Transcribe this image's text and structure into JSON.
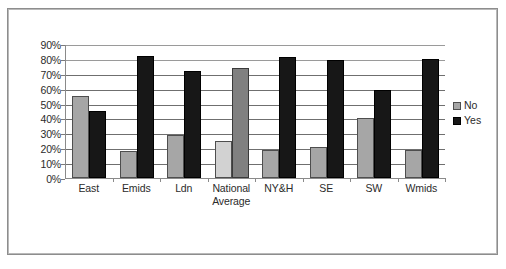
{
  "chart_data": {
    "type": "bar",
    "title": "",
    "subtitle": "",
    "xlabel": "",
    "ylabel": "",
    "ylim": [
      0,
      90
    ],
    "ytick_labels": [
      "90%",
      "80%",
      "70%",
      "60%",
      "50%",
      "40%",
      "30%",
      "20%",
      "10%",
      "0%"
    ],
    "ytick_values": [
      90,
      80,
      70,
      60,
      50,
      40,
      30,
      20,
      10,
      0
    ],
    "grid": true,
    "legend_position": "right",
    "categories": [
      "East",
      "Emids",
      "Ldn",
      "National Average",
      "NY&H",
      "SE",
      "SW",
      "Wmids"
    ],
    "category_lines": [
      [
        "East"
      ],
      [
        "Emids"
      ],
      [
        "Ldn"
      ],
      [
        "National",
        "Average"
      ],
      [
        "NY&H"
      ],
      [
        "SE"
      ],
      [
        "SW"
      ],
      [
        "Wmids"
      ]
    ],
    "series": [
      {
        "name": "No",
        "color": "#a6a6a6",
        "values": [
          55,
          18,
          29,
          25,
          19,
          21,
          40,
          19
        ]
      },
      {
        "name": "Yes",
        "color": "#171717",
        "values": [
          45,
          82,
          72,
          74,
          81,
          79,
          59,
          80
        ]
      }
    ]
  },
  "legend": {
    "items": [
      {
        "label": "No",
        "swatch": "no"
      },
      {
        "label": "Yes",
        "swatch": "yes"
      }
    ]
  },
  "colors": {
    "series_no": "#a6a6a6",
    "series_yes": "#171717",
    "national_average_no": "#d2d2d2",
    "national_average_yes": "#808080",
    "gridline": "#6f6f6f",
    "axis": "#8a8a8a",
    "text": "#2b2b2b",
    "frame_border": "#8d8d8d",
    "background": "#ffffff"
  }
}
